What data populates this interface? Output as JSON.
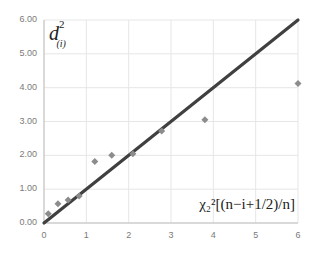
{
  "chart_data": {
    "type": "scatter",
    "title": "",
    "xlabel": "χ²₂[(n−i+1/2)/n]",
    "ylabel": "d²(i)",
    "xlim": [
      0,
      6
    ],
    "ylim": [
      0,
      6
    ],
    "x_ticks": [
      "0",
      "1",
      "2",
      "3",
      "4",
      "5",
      "6"
    ],
    "y_ticks": [
      "0.00",
      "1.00",
      "2.00",
      "3.00",
      "4.00",
      "5.00",
      "6.00"
    ],
    "grid": true,
    "legend": null,
    "series": [
      {
        "name": "observed",
        "marker": "diamond",
        "color": "#8c8c8c",
        "points": [
          {
            "x": 0.1,
            "y": 0.27
          },
          {
            "x": 0.33,
            "y": 0.57
          },
          {
            "x": 0.57,
            "y": 0.68
          },
          {
            "x": 0.83,
            "y": 0.8
          },
          {
            "x": 1.2,
            "y": 1.82
          },
          {
            "x": 1.6,
            "y": 2.0
          },
          {
            "x": 2.1,
            "y": 2.05
          },
          {
            "x": 2.78,
            "y": 2.72
          },
          {
            "x": 3.8,
            "y": 3.05
          },
          {
            "x": 6.0,
            "y": 4.12
          }
        ]
      },
      {
        "name": "reference line y=x",
        "type": "line",
        "color": "#404040",
        "points": [
          {
            "x": 0,
            "y": 0
          },
          {
            "x": 6,
            "y": 6
          }
        ]
      }
    ]
  },
  "labels": {
    "y_axis_main": "d",
    "y_axis_sup": "2",
    "y_axis_sub": "(i)",
    "x_axis": "χ₂²[(n−i+1/2)/n]"
  },
  "colors": {
    "grid": "#e6e6e6",
    "axis": "#bfbfbf",
    "line": "#404040",
    "marker": "#8c8c8c",
    "tick_text": "#7a7a7a"
  }
}
